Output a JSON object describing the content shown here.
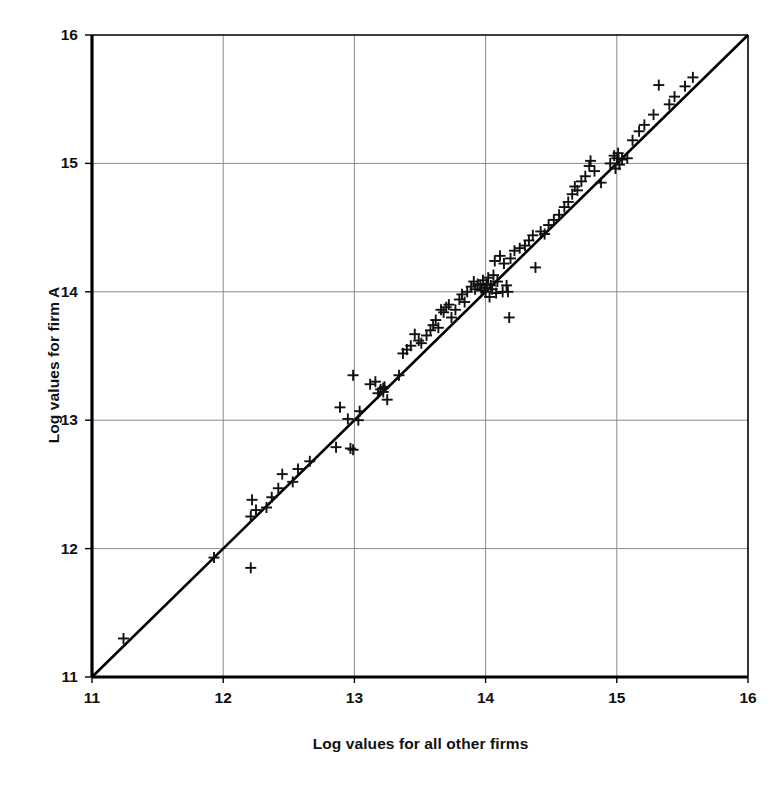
{
  "figure": {
    "scan_artifact_text": "",
    "background_color": "#ffffff",
    "axis_color": "#000000",
    "grid_color": "#8a8a8a",
    "marker_color": "#111111",
    "line_color": "#000000"
  },
  "chart_data": {
    "type": "scatter",
    "title": "",
    "subtitle": "",
    "xlabel": "Log values for all other firms",
    "ylabel": "Log values for firm A",
    "xlim": [
      11,
      16
    ],
    "ylim": [
      11,
      16
    ],
    "xticks": [
      11,
      12,
      13,
      14,
      15,
      16
    ],
    "yticks": [
      11,
      12,
      13,
      14,
      15,
      16
    ],
    "xtick_labels": [
      "11",
      "12",
      "13",
      "14",
      "15",
      "16"
    ],
    "ytick_labels": [
      "11",
      "12",
      "13",
      "14",
      "15",
      "16"
    ],
    "grid": true,
    "legend": null,
    "legend_position": "none",
    "marker": "plus",
    "marker_size": 11,
    "reference_line": {
      "name": "45-degree identity line",
      "from": [
        11.0,
        11.0
      ],
      "to": [
        16.0,
        16.0
      ],
      "style": "solid",
      "width": 2.6
    },
    "annotations": [],
    "series": [
      {
        "name": "Firm A vs all other firms",
        "points": [
          [
            11.24,
            11.3
          ],
          [
            11.93,
            11.93
          ],
          [
            12.21,
            11.85
          ],
          [
            12.21,
            12.25
          ],
          [
            12.22,
            12.38
          ],
          [
            12.25,
            12.3
          ],
          [
            12.33,
            12.32
          ],
          [
            12.37,
            12.4
          ],
          [
            12.42,
            12.47
          ],
          [
            12.45,
            12.58
          ],
          [
            12.53,
            12.52
          ],
          [
            12.57,
            12.62
          ],
          [
            12.66,
            12.68
          ],
          [
            12.86,
            12.79
          ],
          [
            12.89,
            13.1
          ],
          [
            12.95,
            13.01
          ],
          [
            12.97,
            12.78
          ],
          [
            12.99,
            12.77
          ],
          [
            12.99,
            13.35
          ],
          [
            13.03,
            13.0
          ],
          [
            13.04,
            13.07
          ],
          [
            13.12,
            13.28
          ],
          [
            13.16,
            13.3
          ],
          [
            13.18,
            13.21
          ],
          [
            13.2,
            13.24
          ],
          [
            13.22,
            13.25
          ],
          [
            13.22,
            13.22
          ],
          [
            13.23,
            13.26
          ],
          [
            13.25,
            13.16
          ],
          [
            13.34,
            13.35
          ],
          [
            13.37,
            13.52
          ],
          [
            13.4,
            13.55
          ],
          [
            13.43,
            13.58
          ],
          [
            13.46,
            13.67
          ],
          [
            13.49,
            13.62
          ],
          [
            13.51,
            13.6
          ],
          [
            13.55,
            13.66
          ],
          [
            13.58,
            13.7
          ],
          [
            13.6,
            13.74
          ],
          [
            13.62,
            13.78
          ],
          [
            13.64,
            13.72
          ],
          [
            13.66,
            13.86
          ],
          [
            13.68,
            13.84
          ],
          [
            13.7,
            13.88
          ],
          [
            13.72,
            13.9
          ],
          [
            13.74,
            13.8
          ],
          [
            13.77,
            13.86
          ],
          [
            13.8,
            13.94
          ],
          [
            13.82,
            13.98
          ],
          [
            13.84,
            13.92
          ],
          [
            13.86,
            14.0
          ],
          [
            13.89,
            14.04
          ],
          [
            13.91,
            14.08
          ],
          [
            13.92,
            14.02
          ],
          [
            13.94,
            14.06
          ],
          [
            13.96,
            14.05
          ],
          [
            13.97,
            14.01
          ],
          [
            13.98,
            14.09
          ],
          [
            13.99,
            14.03
          ],
          [
            14.0,
            14.0
          ],
          [
            14.01,
            14.06
          ],
          [
            14.02,
            14.11
          ],
          [
            14.03,
            13.96
          ],
          [
            14.04,
            14.05
          ],
          [
            14.05,
            14.02
          ],
          [
            14.06,
            14.13
          ],
          [
            14.07,
            14.24
          ],
          [
            14.08,
            13.99
          ],
          [
            14.09,
            14.08
          ],
          [
            14.11,
            14.28
          ],
          [
            14.13,
            14.0
          ],
          [
            14.14,
            14.22
          ],
          [
            14.16,
            14.05
          ],
          [
            14.17,
            14.0
          ],
          [
            14.18,
            13.8
          ],
          [
            14.19,
            14.26
          ],
          [
            14.22,
            14.32
          ],
          [
            14.26,
            14.34
          ],
          [
            14.3,
            14.36
          ],
          [
            14.33,
            14.4
          ],
          [
            14.36,
            14.44
          ],
          [
            14.38,
            14.19
          ],
          [
            14.42,
            14.47
          ],
          [
            14.45,
            14.45
          ],
          [
            14.48,
            14.52
          ],
          [
            14.52,
            14.56
          ],
          [
            14.56,
            14.6
          ],
          [
            14.6,
            14.66
          ],
          [
            14.63,
            14.7
          ],
          [
            14.66,
            14.76
          ],
          [
            14.68,
            14.82
          ],
          [
            14.7,
            14.79
          ],
          [
            14.73,
            14.86
          ],
          [
            14.76,
            14.9
          ],
          [
            14.79,
            14.98
          ],
          [
            14.8,
            15.02
          ],
          [
            14.83,
            14.94
          ],
          [
            14.88,
            14.85
          ],
          [
            14.95,
            15.0
          ],
          [
            14.98,
            15.06
          ],
          [
            14.99,
            14.96
          ],
          [
            15.0,
            15.04
          ],
          [
            15.01,
            15.08
          ],
          [
            15.02,
            14.99
          ],
          [
            15.04,
            15.03
          ],
          [
            15.08,
            15.04
          ],
          [
            15.12,
            15.18
          ],
          [
            15.17,
            15.25
          ],
          [
            15.21,
            15.3
          ],
          [
            15.28,
            15.38
          ],
          [
            15.32,
            15.61
          ],
          [
            15.4,
            15.46
          ],
          [
            15.44,
            15.52
          ],
          [
            15.52,
            15.6
          ],
          [
            15.58,
            15.67
          ]
        ]
      }
    ]
  },
  "axes": {
    "x_tick_labels": [
      "11",
      "12",
      "13",
      "14",
      "15",
      "16"
    ],
    "y_tick_labels": [
      "11",
      "12",
      "13",
      "14",
      "15",
      "16"
    ],
    "x_axis_title": "Log values for all other firms",
    "y_axis_title": "Log values for firm A"
  }
}
